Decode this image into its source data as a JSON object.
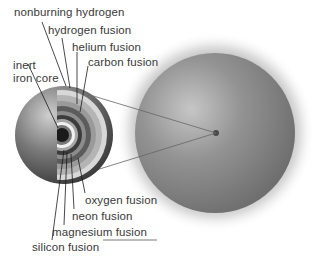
{
  "diagram": {
    "labels": {
      "nonburning_hydrogen": "nonburning hydrogen",
      "hydrogen_fusion": "hydrogen fusion",
      "helium_fusion": "helium fusion",
      "carbon_fusion": "carbon fusion",
      "inert_line1": "inert",
      "inert_line2": "iron core",
      "oxygen_fusion": "oxygen fusion",
      "neon_fusion": "neon fusion",
      "magnesium_fusion": "magnesium fusion",
      "silicon_fusion": "silicon fusion"
    },
    "colors": {
      "background": "#ffffff",
      "star_surface": "#8a8a8a",
      "label_text": "#3a3a3a",
      "leader_line": "#1a1a1a"
    }
  }
}
